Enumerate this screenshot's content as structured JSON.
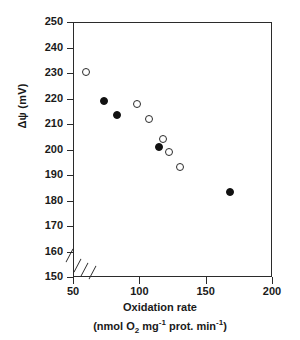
{
  "figure": {
    "background": "#ffffff",
    "axis_color": "#2b2b2b",
    "marker_fill_color": "#111111"
  },
  "axes": {
    "y": {
      "label": "Δψ (mV)",
      "ticks": [
        250,
        240,
        230,
        220,
        210,
        200,
        190,
        180,
        170,
        160,
        150
      ],
      "range": [
        150,
        250
      ],
      "axis_break": true
    },
    "x": {
      "label_line1": "Oxidation rate",
      "label_line2_prefix": "(nmol O",
      "label_line2_sub1": "2",
      "label_line2_mid1": " mg",
      "label_line2_sup1": "-1",
      "label_line2_mid2": " prot. min",
      "label_line2_sup2": "-1",
      "label_line2_suffix": ")",
      "ticks": [
        50,
        100,
        150,
        200
      ],
      "range": [
        50,
        200
      ],
      "axis_break": true
    }
  },
  "chart_data": {
    "type": "scatter",
    "title": "",
    "xlabel": "Oxidation rate (nmol O2 mg-1 prot. min-1)",
    "ylabel": "Δψ (mV)",
    "xlim": [
      50,
      200
    ],
    "ylim": [
      150,
      250
    ],
    "grid": false,
    "legend": "none",
    "axis_break_x": true,
    "axis_break_y": true,
    "series": [
      {
        "name": "open-circles",
        "marker": "open circle",
        "points": [
          {
            "x": 60,
            "y": 230.5
          },
          {
            "x": 98,
            "y": 218.0
          },
          {
            "x": 107,
            "y": 212.0
          },
          {
            "x": 118,
            "y": 204.0
          },
          {
            "x": 122,
            "y": 199.0
          },
          {
            "x": 131,
            "y": 193.0
          }
        ]
      },
      {
        "name": "filled-circles",
        "marker": "filled circle",
        "points": [
          {
            "x": 73,
            "y": 219.0
          },
          {
            "x": 83,
            "y": 213.5
          },
          {
            "x": 115,
            "y": 201.0
          },
          {
            "x": 168,
            "y": 183.5
          }
        ]
      }
    ]
  }
}
